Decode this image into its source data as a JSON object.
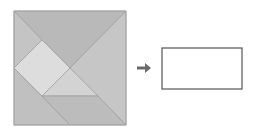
{
  "diagram": {
    "tangram": {
      "outline": {
        "x": 14,
        "y": 11,
        "w": 112,
        "h": 114,
        "stroke": "#a8a8a8"
      },
      "pieces": [
        {
          "name": "top-large-triangle",
          "points": "14,11 126,11 70,68",
          "fill": "#b9b9b9"
        },
        {
          "name": "right-large-triangle",
          "points": "126,11 126,125 70,68",
          "fill": "#c6c6c6"
        },
        {
          "name": "top-left-small-triangle",
          "points": "14,11 42,40 14,68",
          "fill": "#c4c4c4"
        },
        {
          "name": "square",
          "points": "14,68 42,40 70,68 42,96",
          "fill": "#dddddd"
        },
        {
          "name": "middle-small-triangle",
          "points": "70,68 98,96 42,96",
          "fill": "#d3d3d3"
        },
        {
          "name": "bottom-left-medium-triangle",
          "points": "14,68 70,125 14,125",
          "fill": "#c0c0c0"
        },
        {
          "name": "parallelogram",
          "points": "42,96 98,96 126,125 70,125",
          "fill": "#bcbcbc"
        }
      ],
      "edge_color": "#a0a0a0"
    },
    "arrow": {
      "symbol": "right-arrow",
      "x1": 137,
      "x2": 151,
      "y": 68,
      "color": "#6a6a6a"
    },
    "target_rectangle": {
      "x": 162,
      "y": 48,
      "w": 80,
      "h": 41,
      "stroke": "#555555",
      "fill": "#ffffff"
    }
  }
}
